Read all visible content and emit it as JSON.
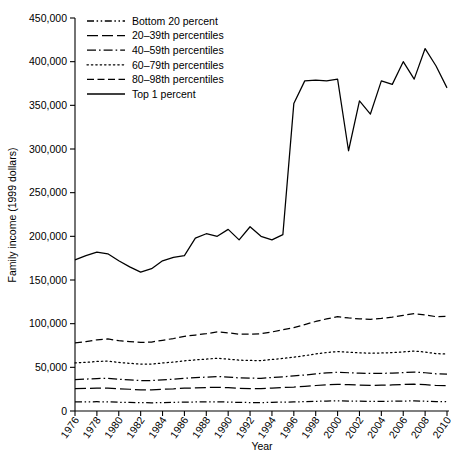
{
  "chart_data": {
    "type": "line",
    "title": "",
    "xlabel": "Year",
    "ylabel": "Family income (1999 dollars)",
    "xlim": [
      1976,
      2010
    ],
    "ylim": [
      0,
      450000
    ],
    "grid": false,
    "legend_position": "top-left",
    "ytick_labels": [
      "0",
      "50,000",
      "100,000",
      "150,000",
      "200,000",
      "250,000",
      "300,000",
      "350,000",
      "400,000",
      "450,000"
    ],
    "ytick_values": [
      0,
      50000,
      100000,
      150000,
      200000,
      250000,
      300000,
      350000,
      400000,
      450000
    ],
    "xtick_labels": [
      "1976",
      "1978",
      "1980",
      "1982",
      "1984",
      "1986",
      "1988",
      "1990",
      "1992",
      "1994",
      "1996",
      "1998",
      "2000",
      "2002",
      "2004",
      "2006",
      "2008",
      "2010"
    ],
    "xtick_values": [
      1976,
      1978,
      1980,
      1982,
      1984,
      1986,
      1988,
      1990,
      1992,
      1994,
      1996,
      1998,
      2000,
      2002,
      2004,
      2006,
      2008,
      2010
    ],
    "x": [
      1976,
      1977,
      1978,
      1979,
      1980,
      1981,
      1982,
      1983,
      1984,
      1985,
      1986,
      1987,
      1988,
      1989,
      1990,
      1991,
      1992,
      1993,
      1994,
      1995,
      1996,
      1997,
      1998,
      1999,
      2000,
      2001,
      2002,
      2003,
      2004,
      2005,
      2006,
      2007,
      2008,
      2009,
      2010
    ],
    "series": [
      {
        "name": "Bottom 20 percent",
        "dash": "dashdotdot",
        "values": [
          10500,
          10500,
          10600,
          10500,
          10000,
          9800,
          9500,
          9400,
          9700,
          9900,
          10200,
          10300,
          10400,
          10500,
          10200,
          9800,
          9700,
          9600,
          9900,
          10200,
          10400,
          10700,
          11100,
          11400,
          11600,
          11400,
          11200,
          11100,
          11100,
          11200,
          11400,
          11500,
          11200,
          10800,
          10700
        ]
      },
      {
        "name": "20–39th percentiles",
        "dash": "dashed-long",
        "values": [
          25500,
          25800,
          26200,
          26300,
          25400,
          24900,
          24200,
          24100,
          24800,
          25300,
          26100,
          26500,
          26900,
          27200,
          26700,
          26000,
          25700,
          25600,
          26200,
          26900,
          27400,
          28200,
          29200,
          30000,
          30500,
          30100,
          29700,
          29400,
          29500,
          29800,
          30300,
          30700,
          30100,
          29200,
          28900
        ]
      },
      {
        "name": "40–59th percentiles",
        "dash": "dashdot",
        "values": [
          36000,
          36500,
          37200,
          37500,
          36300,
          35600,
          34900,
          34800,
          35700,
          36400,
          37500,
          38200,
          38800,
          39500,
          38800,
          37900,
          37600,
          37400,
          38300,
          39200,
          40100,
          41200,
          42500,
          43700,
          44400,
          43800,
          43300,
          43000,
          43100,
          43400,
          44000,
          44600,
          43800,
          42600,
          42300
        ]
      },
      {
        "name": "60–79th percentiles",
        "dash": "dotted",
        "values": [
          55000,
          55700,
          56700,
          57200,
          55600,
          54600,
          53700,
          53700,
          55000,
          56000,
          57500,
          58500,
          59400,
          60400,
          59400,
          58200,
          57900,
          57700,
          59000,
          60200,
          61600,
          63400,
          65300,
          67000,
          68100,
          67300,
          66600,
          66200,
          66400,
          66900,
          67700,
          68600,
          67500,
          65700,
          65200
        ]
      },
      {
        "name": "80–98th percentiles",
        "dash": "dashed",
        "values": [
          78000,
          79500,
          81500,
          82500,
          80500,
          79500,
          78500,
          79000,
          81000,
          83000,
          85500,
          87000,
          88500,
          90500,
          89500,
          88000,
          88000,
          88500,
          90500,
          93000,
          95500,
          99000,
          102500,
          105500,
          108000,
          106500,
          105500,
          105000,
          106000,
          107500,
          109500,
          111500,
          110000,
          108000,
          108500
        ]
      },
      {
        "name": "Top 1 percent",
        "dash": "solid",
        "values": [
          173000,
          178000,
          182000,
          180000,
          172000,
          165000,
          159000,
          163000,
          172000,
          176000,
          178000,
          198000,
          203000,
          200000,
          208000,
          196000,
          211000,
          200000,
          196000,
          202000,
          352000,
          378000,
          379000,
          378000,
          380000,
          298000,
          355000,
          340000,
          378000,
          374000,
          400000,
          380000,
          415000,
          395000,
          370000
        ]
      }
    ]
  },
  "legend": {
    "items": [
      {
        "label": "Bottom 20 percent",
        "dash": "dashdotdot"
      },
      {
        "label": "20–39th percentiles",
        "dash": "dashed-long"
      },
      {
        "label": "40–59th percentiles",
        "dash": "dashdot"
      },
      {
        "label": "60–79th percentiles",
        "dash": "dotted"
      },
      {
        "label": "80–98th percentiles",
        "dash": "dashed"
      },
      {
        "label": "Top 1 percent",
        "dash": "solid"
      }
    ]
  },
  "colors": {
    "line": "#000000",
    "axis": "#000000",
    "background": "#ffffff"
  }
}
